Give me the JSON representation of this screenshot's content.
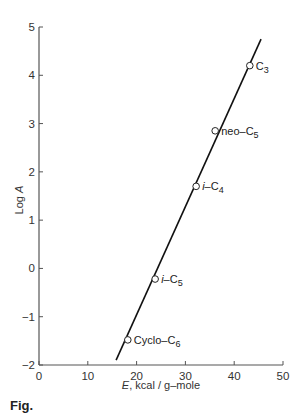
{
  "chart_data": {
    "type": "scatter",
    "title": "",
    "xlabel_italic": "E",
    "xlabel_rest": ", kcal / g–mole",
    "ylabel": "Log A",
    "xlim": [
      0,
      50
    ],
    "ylim": [
      -2,
      5
    ],
    "xticks": [
      0,
      10,
      20,
      30,
      40,
      50
    ],
    "yticks": [
      -2,
      -1,
      0,
      1,
      2,
      3,
      4,
      5
    ],
    "grid": false,
    "points": [
      {
        "label": "C₃",
        "x": 43.2,
        "y": 4.2
      },
      {
        "label": "neo–C₅",
        "x": 36.1,
        "y": 2.85
      },
      {
        "label": "i–C₄",
        "x": 32.2,
        "y": 1.7
      },
      {
        "label": "i–C₅",
        "x": 23.8,
        "y": -0.22
      },
      {
        "label": "Cyclo–C₆",
        "x": 18.2,
        "y": -1.48
      }
    ],
    "fit_line": {
      "x": [
        15.8,
        45.5
      ],
      "y": [
        -1.9,
        4.75
      ]
    }
  },
  "caption": "Fig."
}
